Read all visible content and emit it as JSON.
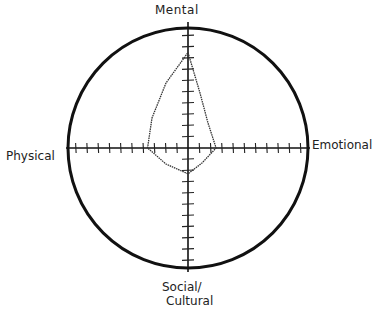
{
  "diagram": {
    "type": "radar-quadrant",
    "axes": {
      "top": "Mental",
      "left": "Physical",
      "right": "Emotional",
      "bottom_line1": "Social/",
      "bottom_line2": "Cultural"
    },
    "ticks_per_half_axis": 10,
    "colors": {
      "stroke": "#111111",
      "shape": "#333333",
      "background": "#ffffff"
    }
  },
  "chart_data": {
    "type": "radar",
    "title": "",
    "axes": [
      "Mental",
      "Emotional",
      "Social/Cultural",
      "Physical"
    ],
    "scale_max": 10,
    "values": [
      8.5,
      2.5,
      2.3,
      3.6
    ],
    "grid": false,
    "legend": null
  }
}
